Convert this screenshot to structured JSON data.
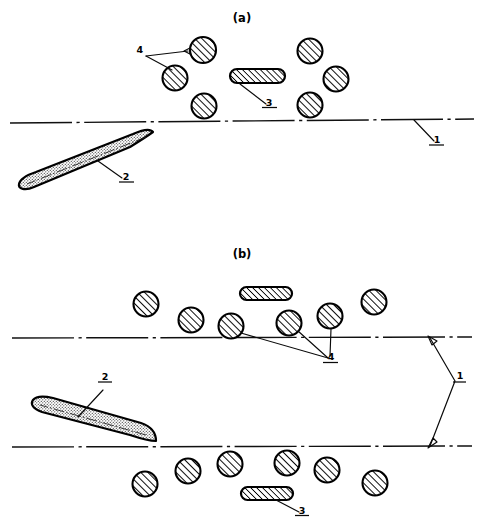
{
  "figure": {
    "width": 484,
    "height": 532,
    "background_color": "#ffffff",
    "line_color": "#000000"
  },
  "panels": [
    {
      "id": "a",
      "caption": "(a)",
      "caption_x": 242,
      "caption_y": 22,
      "description": "Single chain boundary line with submarine below and mines above",
      "boundary_lines": [
        {
          "name": "waterline",
          "x1": 10,
          "y1": 123,
          "x2": 474,
          "y2": 119
        }
      ],
      "reference_labels": [
        {
          "number": "4",
          "x": 146,
          "y": 51,
          "underline": false
        },
        {
          "number": "3",
          "x": 268,
          "y": 106,
          "underline": true
        },
        {
          "number": "1",
          "x": 437,
          "y": 143,
          "underline": true
        },
        {
          "number": "2",
          "x": 126,
          "y": 180,
          "underline": true
        }
      ]
    },
    {
      "id": "b",
      "caption": "(b)",
      "caption_x": 242,
      "caption_y": 258,
      "description": "Two parallel chain boundary lines forming a channel, submarine inside, mines above and below",
      "boundary_lines": [
        {
          "name": "upper-channel-line",
          "x1": 12,
          "y1": 338,
          "x2": 472,
          "y2": 337
        },
        {
          "name": "lower-channel-line",
          "x1": 12,
          "y1": 447,
          "x2": 472,
          "y2": 446
        }
      ],
      "reference_labels": [
        {
          "number": "2",
          "x": 104,
          "y": 387,
          "underline": true
        },
        {
          "number": "4",
          "x": 330,
          "y": 358,
          "underline": true
        },
        {
          "number": "1",
          "x": 459,
          "y": 378,
          "underline": true
        },
        {
          "number": "3",
          "x": 301,
          "y": 510,
          "underline": true
        }
      ]
    }
  ],
  "legend_keys": {
    "1": "boundary / channel limit line",
    "2": "submarine",
    "3": "elongated mine (stadium)",
    "4": "round mine"
  },
  "mines": {
    "panel_a_circles": [
      {
        "cx": 203,
        "cy": 50,
        "r": 13
      },
      {
        "cx": 175,
        "cy": 78,
        "r": 12.5
      },
      {
        "cx": 204,
        "cy": 106,
        "r": 12.5
      },
      {
        "cx": 310,
        "cy": 51,
        "r": 12.5
      },
      {
        "cx": 336,
        "cy": 79,
        "r": 12.5
      },
      {
        "cx": 310,
        "cy": 105,
        "r": 12.5
      }
    ],
    "panel_a_stadiums": [
      {
        "x": 230,
        "y": 69,
        "w": 55,
        "h": 14
      }
    ],
    "panel_b_circles_above": [
      {
        "cx": 146,
        "cy": 304,
        "r": 12.5
      },
      {
        "cx": 191,
        "cy": 320,
        "r": 12.5
      },
      {
        "cx": 231,
        "cy": 326,
        "r": 12.5
      },
      {
        "cx": 289,
        "cy": 323,
        "r": 12.5
      },
      {
        "cx": 330,
        "cy": 316,
        "r": 12.5
      },
      {
        "cx": 374,
        "cy": 302,
        "r": 12.5
      }
    ],
    "panel_b_stadiums_above": [
      {
        "x": 240,
        "y": 287,
        "w": 52,
        "h": 13
      }
    ],
    "panel_b_circles_below": [
      {
        "cx": 145,
        "cy": 484,
        "r": 12.5
      },
      {
        "cx": 188,
        "cy": 471,
        "r": 12.5
      },
      {
        "cx": 230,
        "cy": 464,
        "r": 12.5
      },
      {
        "cx": 287,
        "cy": 463,
        "r": 12.5
      },
      {
        "cx": 327,
        "cy": 470,
        "r": 12.5
      },
      {
        "cx": 375,
        "cy": 483,
        "r": 12.5
      }
    ],
    "panel_b_stadiums_below": [
      {
        "x": 241,
        "y": 487,
        "w": 52,
        "h": 13
      }
    ]
  },
  "submarines": [
    {
      "panel": "a",
      "bow_x": 152,
      "bow_y": 133,
      "stern_x": 20,
      "stern_y": 188,
      "beam": 17,
      "heading": "up-right"
    },
    {
      "panel": "b",
      "bow_x": 155,
      "bow_y": 440,
      "stern_x": 32,
      "stern_y": 407,
      "beam": 17,
      "heading": "down-right"
    }
  ]
}
